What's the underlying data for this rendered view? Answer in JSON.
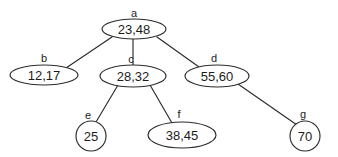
{
  "diagram": {
    "type": "tree-diagram",
    "title": "",
    "background_color": "#ffffff",
    "stroke_color": "#2b2b2b",
    "text_color": "#1c1c1c",
    "nodes": [
      {
        "id": "a",
        "label": "a",
        "value": "23,48",
        "keys": [
          "23",
          "48"
        ],
        "shape": "ellipse",
        "cx": 134,
        "cy": 29,
        "rx": 32,
        "ry": 10,
        "label_x": 134,
        "label_y": 13
      },
      {
        "id": "b",
        "label": "b",
        "value": "12,17",
        "keys": [
          "12",
          "17"
        ],
        "shape": "ellipse",
        "cx": 44,
        "cy": 75,
        "rx": 34,
        "ry": 10,
        "label_x": 44,
        "label_y": 58
      },
      {
        "id": "c",
        "label": "c",
        "value": "28,32",
        "keys": [
          "28",
          "32"
        ],
        "shape": "ellipse",
        "cx": 133,
        "cy": 76,
        "rx": 33,
        "ry": 11,
        "label_x": 131,
        "label_y": 59
      },
      {
        "id": "d",
        "label": "d",
        "value": "55,60",
        "keys": [
          "55",
          "60"
        ],
        "shape": "ellipse",
        "cx": 217,
        "cy": 76,
        "rx": 32,
        "ry": 11,
        "label_x": 214,
        "label_y": 58
      },
      {
        "id": "e",
        "label": "e",
        "value": "25",
        "keys": [
          "25"
        ],
        "shape": "circle",
        "cx": 91,
        "cy": 136,
        "rx": 15,
        "ry": 15,
        "label_x": 88,
        "label_y": 115
      },
      {
        "id": "f",
        "label": "f",
        "value": "38,45",
        "keys": [
          "38",
          "45"
        ],
        "shape": "ellipse",
        "cx": 182,
        "cy": 135,
        "rx": 34,
        "ry": 13,
        "label_x": 179,
        "label_y": 114
      },
      {
        "id": "g",
        "label": "g",
        "value": "70",
        "keys": [
          "70"
        ],
        "shape": "circle",
        "cx": 305,
        "cy": 136,
        "rx": 15,
        "ry": 15,
        "label_x": 303,
        "label_y": 114
      }
    ],
    "edges": [
      {
        "id": "a-b",
        "from": "a",
        "to": "b",
        "x1": 112,
        "y1": 37,
        "x2": 66,
        "y2": 68
      },
      {
        "id": "a-c",
        "from": "a",
        "to": "c",
        "x1": 133,
        "y1": 39,
        "x2": 133,
        "y2": 65
      },
      {
        "id": "a-d",
        "from": "a",
        "to": "d",
        "x1": 157,
        "y1": 37,
        "x2": 199,
        "y2": 67
      },
      {
        "id": "c-e",
        "from": "c",
        "to": "e",
        "x1": 118,
        "y1": 85,
        "x2": 96,
        "y2": 122
      },
      {
        "id": "c-f",
        "from": "c",
        "to": "f",
        "x1": 150,
        "y1": 85,
        "x2": 172,
        "y2": 123
      },
      {
        "id": "d-g",
        "from": "d",
        "to": "g",
        "x1": 238,
        "y1": 84,
        "x2": 297,
        "y2": 125
      }
    ]
  }
}
